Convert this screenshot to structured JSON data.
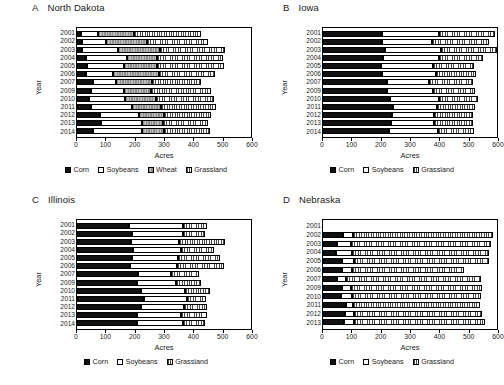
{
  "figure": {
    "axis_titles": {
      "x": "Acres",
      "y": "Year"
    }
  },
  "chart_data": [
    {
      "type": "bar",
      "orientation": "horizontal",
      "stacked": true,
      "panel_letter": "A",
      "title": "North Dakota",
      "xlabel": "Acres",
      "ylabel": "Year",
      "xlim": [
        0,
        600
      ],
      "xticks": [
        0,
        100,
        200,
        300,
        400,
        500,
        600
      ],
      "grid": false,
      "legend_position": "bottom",
      "categories": [
        "2001",
        "2002",
        "2003",
        "2004",
        "2005",
        "2006",
        "2007",
        "2009",
        "2010",
        "2011",
        "2012",
        "2013",
        "2014"
      ],
      "series": [
        {
          "name": "Corn",
          "values": [
            13,
            16,
            18,
            32,
            34,
            30,
            56,
            47,
            42,
            48,
            78,
            83,
            55
          ]
        },
        {
          "name": "Soybeans",
          "values": [
            60,
            84,
            124,
            140,
            129,
            94,
            80,
            115,
            122,
            140,
            135,
            142,
            170
          ]
        },
        {
          "name": "Wheat",
          "values": [
            122,
            142,
            145,
            105,
            112,
            160,
            122,
            92,
            110,
            100,
            88,
            72,
            75
          ]
        },
        {
          "name": "Grassland",
          "values": [
            232,
            210,
            222,
            225,
            233,
            192,
            168,
            207,
            198,
            192,
            162,
            155,
            160
          ]
        }
      ],
      "totals": [
        427,
        452,
        509,
        502,
        508,
        476,
        426,
        461,
        472,
        480,
        463,
        452,
        460
      ]
    },
    {
      "type": "bar",
      "orientation": "horizontal",
      "stacked": true,
      "panel_letter": "B",
      "title": "Iowa",
      "xlabel": "Acres",
      "ylabel": "Year",
      "xlim": [
        0,
        600
      ],
      "xticks": [
        0,
        100,
        200,
        300,
        400,
        500,
        600
      ],
      "grid": false,
      "legend_position": "bottom",
      "categories": [
        "2001",
        "2002",
        "2003",
        "2004",
        "2005",
        "2006",
        "2007",
        "2009",
        "2010",
        "2011",
        "2012",
        "2013",
        "2014"
      ],
      "series": [
        {
          "name": "Corn",
          "values": [
            204,
            202,
            213,
            208,
            199,
            205,
            221,
            219,
            232,
            241,
            238,
            236,
            229
          ]
        },
        {
          "name": "Soybeans",
          "values": [
            196,
            175,
            195,
            192,
            182,
            184,
            146,
            162,
            168,
            152,
            144,
            146,
            166
          ]
        },
        {
          "name": "Grassland",
          "values": [
            192,
            196,
            194,
            152,
            140,
            137,
            152,
            144,
            134,
            130,
            137,
            137,
            127
          ]
        }
      ],
      "totals": [
        592,
        573,
        602,
        552,
        521,
        526,
        519,
        525,
        534,
        523,
        519,
        519,
        522
      ]
    },
    {
      "type": "bar",
      "orientation": "horizontal",
      "stacked": true,
      "panel_letter": "C",
      "title": "Illinois",
      "xlabel": "Acres",
      "ylabel": "Year",
      "xlim": [
        0,
        600
      ],
      "xticks": [
        0,
        100,
        200,
        300,
        400,
        500,
        600
      ],
      "grid": false,
      "legend_position": "bottom",
      "categories": [
        "2001",
        "2002",
        "2003",
        "2004",
        "2005",
        "2006",
        "2007",
        "2009",
        "2010",
        "2011",
        "2012",
        "2013",
        "2014"
      ],
      "series": [
        {
          "name": "Corn",
          "values": [
            181,
            190,
            185,
            192,
            190,
            182,
            211,
            206,
            221,
            232,
            219,
            208,
            208
          ]
        },
        {
          "name": "Soybeans",
          "values": [
            184,
            177,
            166,
            167,
            159,
            163,
            114,
            135,
            152,
            148,
            151,
            151,
            157
          ]
        },
        {
          "name": "Grassland",
          "values": [
            82,
            75,
            160,
            112,
            144,
            163,
            96,
            86,
            84,
            64,
            77,
            88,
            77
          ]
        }
      ],
      "totals": [
        447,
        442,
        511,
        471,
        493,
        508,
        421,
        427,
        457,
        444,
        447,
        447,
        442
      ]
    },
    {
      "type": "bar",
      "orientation": "horizontal",
      "stacked": true,
      "panel_letter": "D",
      "title": "Nebraska",
      "xlabel": "Acres",
      "ylabel": "Year",
      "xlim": [
        0,
        600
      ],
      "xticks": [
        0,
        100,
        200,
        300,
        400,
        500,
        600
      ],
      "grid": false,
      "legend_position": "bottom",
      "categories": [
        "2001",
        "2002",
        "2003",
        "2004",
        "2005",
        "2006",
        "2007",
        "2009",
        "2010",
        "2011",
        "2012",
        "2013"
      ],
      "series": [
        {
          "name": "Corn",
          "values": [
            0,
            70,
            48,
            44,
            66,
            65,
            48,
            66,
            62,
            79,
            75,
            72
          ]
        },
        {
          "name": "Soybeans",
          "values": [
            0,
            32,
            50,
            56,
            42,
            36,
            30,
            29,
            37,
            26,
            32,
            36
          ]
        },
        {
          "name": "Grassland",
          "values": [
            0,
            483,
            480,
            471,
            465,
            386,
            468,
            452,
            447,
            436,
            443,
            450
          ]
        }
      ],
      "totals": [
        0,
        585,
        578,
        571,
        573,
        487,
        546,
        547,
        546,
        541,
        550,
        558
      ]
    }
  ],
  "legends": {
    "four": [
      {
        "key": "corn",
        "label": "Corn"
      },
      {
        "key": "soy",
        "label": "Soybeans"
      },
      {
        "key": "wheat",
        "label": "Wheat"
      },
      {
        "key": "grass",
        "label": "Grassland"
      }
    ],
    "three": [
      {
        "key": "corn",
        "label": "Corn"
      },
      {
        "key": "soy",
        "label": "Soybeans"
      },
      {
        "key": "grass",
        "label": "Grassland"
      }
    ]
  }
}
